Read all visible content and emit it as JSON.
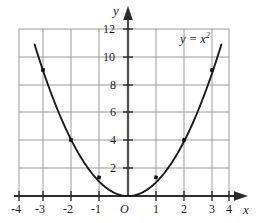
{
  "chart_data": {
    "type": "line",
    "title": "",
    "subtitle": "",
    "xlabel": "x",
    "ylabel": "y",
    "equation_label": "y = x",
    "equation_exponent": "2",
    "origin_label": "O",
    "xlim": [
      -4,
      4
    ],
    "ylim": [
      0,
      12
    ],
    "grid": true,
    "legend_position": "inside-top-right",
    "x_ticks": [
      -4,
      -3,
      -2,
      -1,
      0,
      1,
      2,
      3,
      4
    ],
    "x_tick_labels": [
      "-4",
      "-3",
      "-2",
      "-1",
      "O",
      "1",
      "2",
      "3",
      "4"
    ],
    "y_ticks": [
      2,
      4,
      6,
      8,
      10,
      12
    ],
    "y_tick_labels": [
      "2",
      "4",
      "6",
      "8",
      "10",
      "12"
    ],
    "grid_x_lines": [
      -3,
      -2,
      -1,
      0,
      1,
      2,
      3
    ],
    "grid_y_lines": [
      2,
      4,
      6,
      8,
      10,
      12
    ],
    "series": [
      {
        "name": "y = x^2",
        "x": [
          -3.3,
          -3,
          -2.5,
          -2,
          -1.5,
          -1,
          -0.5,
          0,
          0.5,
          1,
          1.5,
          2,
          2.5,
          3,
          3.3
        ],
        "y": [
          10.89,
          9,
          6.25,
          4,
          2.25,
          1,
          0.25,
          0,
          0.25,
          1,
          2.25,
          4,
          6.25,
          9,
          10.89
        ]
      }
    ],
    "marked_points": [
      {
        "x": -3,
        "y": 9
      },
      {
        "x": -2,
        "y": 4
      },
      {
        "x": -1,
        "y": 1
      },
      {
        "x": 1,
        "y": 1
      },
      {
        "x": 2,
        "y": 4
      },
      {
        "x": 3,
        "y": 9
      }
    ],
    "colors": {
      "curve": "#1a1a1a",
      "grid": "#9a9a9a",
      "axis": "#4d4d4d",
      "text": "#1a1a1a",
      "background": "#ffffff"
    }
  }
}
